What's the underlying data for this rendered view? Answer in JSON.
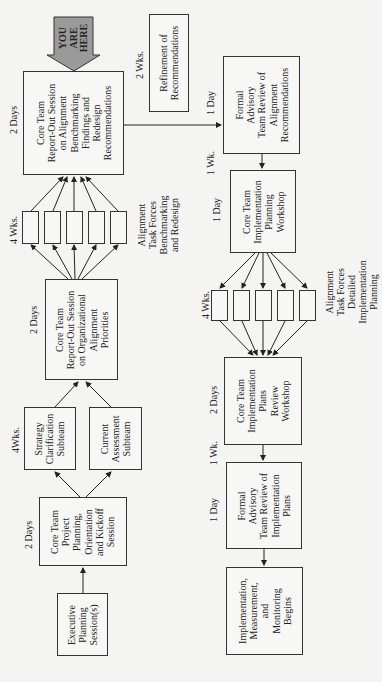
{
  "diagram": {
    "orientation": "rotated-90-ccw",
    "colors": {
      "box_border": "#333333",
      "background": "#f4f4f2",
      "you_are_here_fill": "#9a9a9a"
    },
    "you_are_here": "YOU\nARE\nHERE",
    "phase1": {
      "executive": "Executive\nPlanning\nSession(s)",
      "kickoff": "Core Team\nProject\nPlanning,\nOrientation\nand Kickoff\nSession",
      "kickoff_duration": "2 Days",
      "strategy_subteam": "Strategy\nClarification\nSubteam",
      "assessment_subteam": "Current\nAssessment\nSubteam",
      "subteams_duration": "4Wks.",
      "org_alignment": "Core Team\nReport-Out Session\non Organizational\nAlignment\nPriorities",
      "org_alignment_duration": "2 Days",
      "task_forces_label": "Alignment\nTask Forces\nBenchmarking\nand Redesign",
      "task_forces_duration": "4 Wks.",
      "benchmarking_report": "Core Team\nReport-Out Session\non Alignment\nBenchmarking\nFindings and\nRedesign\nRecommendations",
      "benchmarking_report_duration": "2 Days",
      "refinement": "Refinement of\nRecommendations",
      "refinement_duration": "2 Wks."
    },
    "phase2": {
      "advisory_alignment": "Formal\nAdvisory\nTeam Review of\nAlignment\nRecommendations",
      "advisory_alignment_duration": "1 Day",
      "gap1": "1 Wk.",
      "impl_planning": "Core Team\nImplementation\nPlanning\nWorkshop",
      "impl_planning_duration": "1 Day",
      "task_forces_label": "Alignment\nTask Forces\nDetailed\nImplementation\nPlanning",
      "task_forces_duration": "4 Wks.",
      "plans_review": "Core Team\nImplementation\nPlans\nReview\nWorkshop",
      "plans_review_duration": "2 Days",
      "gap2": "1 Wk.",
      "advisory_plans": "Formal\nAdvisory\nTeam Review of\nImplementation\nPlans",
      "advisory_plans_duration": "1 Day",
      "implementation": "Implementation,\nMeasurement,\nand\nMonitoring\nBegins"
    }
  }
}
